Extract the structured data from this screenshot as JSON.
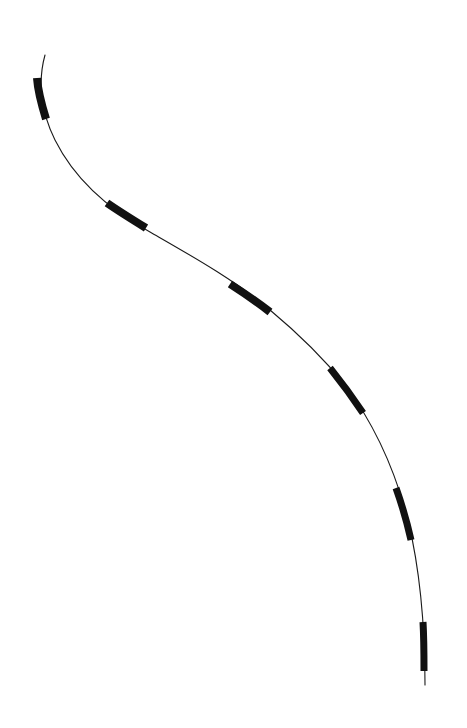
{
  "diagram": {
    "background": "#ffffff",
    "curve": {
      "color": "#1a1a1a",
      "width": 1.1,
      "path": "M45,55 C38,80 40,110 55,140 C75,180 110,210 150,232 C190,255 235,280 270,310 C300,335 325,360 345,385 C375,425 395,470 408,520 C420,570 425,620 425,685"
    },
    "segments": [
      {
        "path": "M37,78 C38,92 42,106 46,119",
        "width": 8
      },
      {
        "path": "M107,203 C120,212 133,220 146,228",
        "width": 8
      },
      {
        "path": "M230,284 C244,293 257,302 270,312",
        "width": 8
      },
      {
        "path": "M330,368 C342,383 353,398 363,413",
        "width": 7
      },
      {
        "path": "M396,488 C402,505 407,522 411,540",
        "width": 7
      },
      {
        "path": "M423,622 C424,639 424,655 424,671",
        "width": 7
      }
    ],
    "segment_color": "#111111"
  }
}
